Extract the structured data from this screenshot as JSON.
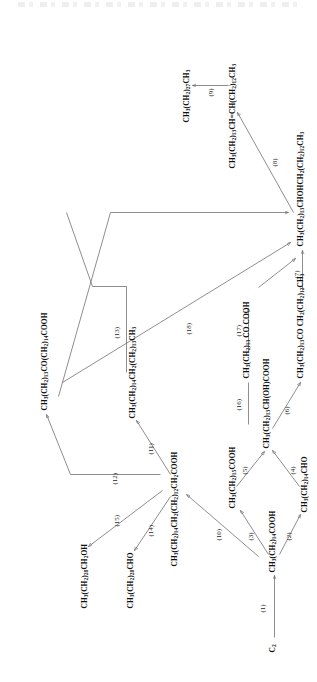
{
  "figure": {
    "type": "reaction-scheme",
    "orientation": "rotated-90-ccw",
    "header_faint": "",
    "nodes": [
      {
        "id": "n1",
        "label": "C2",
        "html": "C<sub>2</sub>"
      },
      {
        "id": "n2",
        "label": "CH3(CH2)14COOH",
        "html": "CH<sub>3</sub>(CH<sub>2</sub>)<sub>14</sub>COOH"
      },
      {
        "id": "n3",
        "label": "CH3(CH2)14CHO",
        "html": "CH<sub>3</sub>(CH<sub>2</sub>)<sub>14</sub>CHO"
      },
      {
        "id": "n4",
        "label": "CH3(CH2)15COOH",
        "html": "CH<sub>3</sub>(CH<sub>2</sub>)<sub>15</sub>COOH"
      },
      {
        "id": "n5",
        "label": "CH3(CH2)13CH(OH)COOH",
        "html": "CH<sub>3</sub>(CH<sub>2</sub>)<sub>13</sub>CH(OH)COOH"
      },
      {
        "id": "n6",
        "label": "CH3(CH2)13 CO COOH",
        "html": "CH<sub>3</sub>(CH<sub>2</sub>)<sub>13</sub> CO COOH"
      },
      {
        "id": "n7",
        "label": "CH3(CH2)13CO(CH2)13CH3",
        "html": "CH<sub>3</sub>(CH<sub>2</sub>)<sub>13</sub>CO CH<sub>2</sub>(CH<sub>2</sub>)<sub>12</sub>CH<sub>3</sub>"
      },
      {
        "id": "n8",
        "label": "CH3(CH2)13CHOHCH2(CH2)12CH3",
        "html": "CH<sub>3</sub>(CH<sub>2</sub>)<sub>13</sub>CHOHCH<sub>2</sub>(CH<sub>2</sub>)<sub>12</sub>CH<sub>3</sub>"
      },
      {
        "id": "n9",
        "label": "CH3(CH2)13CH=CH(CH2)12CH3",
        "html": "CH<sub>3</sub>(CH<sub>2</sub>)<sub>13</sub>CH=CH(CH<sub>2</sub>)<sub>12</sub>CH<sub>3</sub>"
      },
      {
        "id": "n10",
        "label": "CH3(CH2)27CH3",
        "html": "CH<sub>3</sub>(CH<sub>2</sub>)<sub>27</sub>CH<sub>3</sub>"
      },
      {
        "id": "n11",
        "label": "CH3(CH2)14CH2(CH2)12CH2COOH",
        "html": "CH<sub>3</sub>(CH<sub>2</sub>)<sub>14</sub>CH<sub>2</sub>(CH<sub>2</sub>)<sub>12</sub>CH<sub>2</sub>COOH"
      },
      {
        "id": "n12",
        "label": "CH3(CH2)28CHO",
        "html": "CH<sub>3</sub>(CH<sub>2</sub>)<sub>28</sub>CHO"
      },
      {
        "id": "n13",
        "label": "CH3(CH2)28CH2OH",
        "html": "CH<sub>3</sub>(CH<sub>2</sub>)<sub>28</sub>CH<sub>2</sub>OH"
      },
      {
        "id": "n14",
        "label": "CH3(CH2)14CH2(CH2)13CH3",
        "html": "CH<sub>3</sub>(CH<sub>2</sub>)<sub>14</sub>CH<sub>2</sub>(CH<sub>2</sub>)<sub>13</sub>CH<sub>3</sub>"
      },
      {
        "id": "n15",
        "label": "CH3(CH2)13CO(CH2)14COOH",
        "html": "CH<sub>3</sub>(CH<sub>2</sub>)<sub>13</sub>CO(CH<sub>2</sub>)<sub>14</sub>COOH"
      }
    ],
    "reactions": [
      {
        "id": "r1",
        "label": "(1)"
      },
      {
        "id": "r2",
        "label": "(2)"
      },
      {
        "id": "r3",
        "label": "(3)"
      },
      {
        "id": "r4",
        "label": "(4)"
      },
      {
        "id": "r5",
        "label": "(5)"
      },
      {
        "id": "r6",
        "label": "(6)"
      },
      {
        "id": "r7",
        "label": "(7)"
      },
      {
        "id": "r8",
        "label": "(8)"
      },
      {
        "id": "r9",
        "label": "(9)"
      },
      {
        "id": "r10",
        "label": "(10)"
      },
      {
        "id": "r11",
        "label": "(11)"
      },
      {
        "id": "r12",
        "label": "(12)"
      },
      {
        "id": "r13",
        "label": "(13)"
      },
      {
        "id": "r14",
        "label": "(14)"
      },
      {
        "id": "r15",
        "label": "(15)"
      },
      {
        "id": "r16",
        "label": "(16)"
      },
      {
        "id": "r17",
        "label": "(17)"
      },
      {
        "id": "r18",
        "label": "(18)"
      }
    ]
  }
}
